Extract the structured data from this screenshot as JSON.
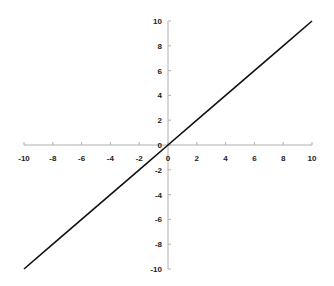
{
  "chart_data": {
    "type": "line",
    "title": "",
    "xlabel": "",
    "ylabel": "",
    "xlim": [
      -10,
      10
    ],
    "ylim": [
      -10,
      10
    ],
    "grid": false,
    "legend": null,
    "x_ticks": [
      -10,
      -8,
      -6,
      -4,
      -2,
      0,
      2,
      4,
      6,
      8,
      10
    ],
    "y_ticks": [
      -10,
      -8,
      -6,
      -4,
      -2,
      0,
      2,
      4,
      6,
      8,
      10
    ],
    "series": [
      {
        "name": "y = x",
        "x": [
          -10,
          -8,
          -6,
          -4,
          -2,
          0,
          2,
          4,
          6,
          8,
          10
        ],
        "y": [
          -10,
          -8,
          -6,
          -4,
          -2,
          0,
          2,
          4,
          6,
          8,
          10
        ],
        "color": "#111111"
      }
    ],
    "axis_color": "#b0b0b0"
  }
}
